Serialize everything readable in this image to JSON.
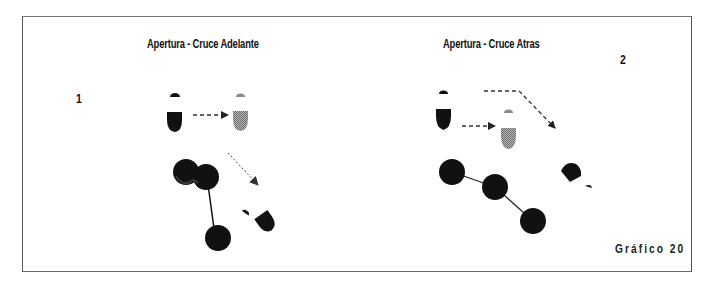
{
  "figure": {
    "caption": "Gráfico 20",
    "colors": {
      "player": "#111111",
      "moved_player": "#8a8a8a",
      "line": "#222222",
      "frame": "#555555"
    }
  },
  "panels": [
    {
      "number": "1",
      "title": "Apertura - Cruce Adelante",
      "elements": [
        "player-start",
        "dashed-arrow-right",
        "player-shaded",
        "dotted-arrow-diagonal",
        "ball-chain-3",
        "player-rotated"
      ]
    },
    {
      "number": "2",
      "title": "Apertura - Cruce Atras",
      "elements": [
        "player-start",
        "dashed-arrow-right",
        "player-shaded",
        "dashed-arrow-bent",
        "ball-chain-3",
        "player-rotated"
      ]
    }
  ]
}
